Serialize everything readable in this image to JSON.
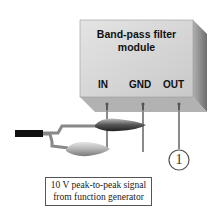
{
  "module": {
    "title_line1": "Band-pass filter",
    "title_line2": "module"
  },
  "terminals": [
    {
      "label": "IN"
    },
    {
      "label": "GND"
    },
    {
      "label": "OUT"
    }
  ],
  "marker": {
    "label": "1"
  },
  "caption": {
    "line1": "10 V peak-to-peak signal",
    "line2": "from function generator"
  },
  "colors": {
    "box_front": "#d8d8d8",
    "box_side": "#9a9a9a",
    "box_bottom": "#b4b4b4",
    "wire": "#8a8a8a",
    "cable": "#111111"
  }
}
